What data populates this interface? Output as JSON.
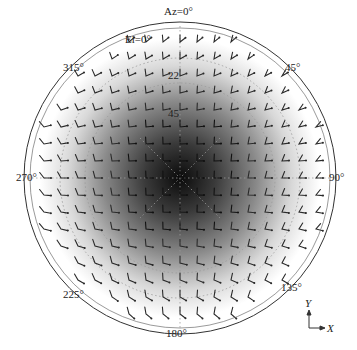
{
  "chart_data": {
    "type": "polar_vector_field",
    "title": "",
    "azimuth_labels": [
      "Az=0°",
      "45°",
      "90°",
      "135°",
      "180°",
      "225°",
      "270°",
      "315°"
    ],
    "azimuth_label_angles": [
      0,
      45,
      90,
      135,
      180,
      225,
      270,
      315
    ],
    "elevation_labels": [
      "El=0°",
      "22",
      "45"
    ],
    "elevation_circles_deg": [
      0,
      22.5,
      45
    ],
    "axes_indicator": {
      "x": "X",
      "y": "Y"
    },
    "colormap": "grayscale",
    "intensity_center": "dark",
    "intensity_edge": "white",
    "grid_on": true
  },
  "labels": {
    "az0": "Az=0°",
    "el0": "El=0°",
    "el22": "22",
    "el45": "45",
    "a45": "45°",
    "a90": "90°",
    "a135": "135°",
    "a180": "180°",
    "a225": "225°",
    "a270": "270°",
    "a315": "315°",
    "axis_x": "X",
    "axis_y": "Y"
  }
}
